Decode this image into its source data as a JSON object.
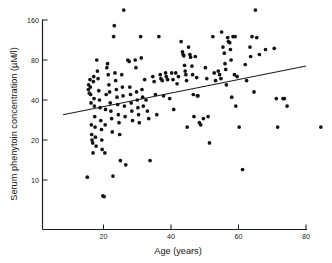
{
  "figure": {
    "name": "serum-phenytoin-vs-age-scatter"
  },
  "axis": {
    "x_title": "Age (years)",
    "y_title": "Serum phenytoin concentration (µM/l)",
    "x_ticks": [
      "20",
      "40",
      "60",
      "80"
    ],
    "y_ticks": [
      "160",
      "80",
      "40",
      "20",
      "10"
    ]
  },
  "chart_data": {
    "type": "scatter",
    "title": "",
    "subtitle": "",
    "xlabel": "Age (years)",
    "ylabel": "Serum phenytoin concentration (µM/l)",
    "xscale": "linear",
    "yscale": "log",
    "xlim": [
      8,
      86
    ],
    "ylim": [
      5,
      190
    ],
    "xticks": [
      20,
      40,
      60,
      80
    ],
    "yticks": [
      10,
      20,
      40,
      80,
      160
    ],
    "grid": false,
    "legend": null,
    "annotations": [],
    "series": [
      {
        "name": "patients",
        "marker": "filled-circle",
        "color": "#121212",
        "points": [
          [
            15.2,
            10.5
          ],
          [
            15.5,
            48
          ],
          [
            15.6,
            52
          ],
          [
            15.8,
            45
          ],
          [
            16.0,
            57
          ],
          [
            16.1,
            50
          ],
          [
            16.2,
            44
          ],
          [
            16.3,
            38
          ],
          [
            16.4,
            26
          ],
          [
            16.5,
            22
          ],
          [
            16.6,
            20
          ],
          [
            16.8,
            19
          ],
          [
            16.9,
            16
          ],
          [
            17.0,
            55
          ],
          [
            17.1,
            60
          ],
          [
            17.2,
            41
          ],
          [
            17.3,
            36
          ],
          [
            17.4,
            30
          ],
          [
            17.5,
            25
          ],
          [
            17.6,
            21
          ],
          [
            17.8,
            18
          ],
          [
            18.0,
            80
          ],
          [
            18.2,
            66
          ],
          [
            18.4,
            58
          ],
          [
            18.6,
            47
          ],
          [
            18.8,
            40
          ],
          [
            19.0,
            35
          ],
          [
            19.2,
            28
          ],
          [
            19.4,
            24
          ],
          [
            19.5,
            20
          ],
          [
            19.6,
            17
          ],
          [
            19.8,
            7.6
          ],
          [
            20.2,
            7.5
          ],
          [
            20.4,
            16
          ],
          [
            20.5,
            26
          ],
          [
            20.6,
            34
          ],
          [
            20.8,
            44
          ],
          [
            21.0,
            70
          ],
          [
            21.2,
            75
          ],
          [
            21.4,
            62
          ],
          [
            21.6,
            52
          ],
          [
            21.8,
            46
          ],
          [
            22.0,
            38
          ],
          [
            22.2,
            33
          ],
          [
            22.4,
            29
          ],
          [
            22.6,
            23
          ],
          [
            22.8,
            10.7
          ],
          [
            23.0,
            120
          ],
          [
            23.2,
            145
          ],
          [
            23.4,
            64
          ],
          [
            23.6,
            56
          ],
          [
            23.8,
            48
          ],
          [
            24.0,
            42
          ],
          [
            24.2,
            37
          ],
          [
            24.4,
            31
          ],
          [
            24.6,
            27
          ],
          [
            24.8,
            22
          ],
          [
            25.0,
            14
          ],
          [
            25.4,
            62
          ],
          [
            25.6,
            50
          ],
          [
            25.8,
            43
          ],
          [
            26.0,
            190
          ],
          [
            26.2,
            36
          ],
          [
            26.4,
            30
          ],
          [
            26.6,
            13
          ],
          [
            27.2,
            80
          ],
          [
            27.6,
            78
          ],
          [
            27.8,
            50
          ],
          [
            28.0,
            44
          ],
          [
            28.2,
            38
          ],
          [
            28.4,
            33
          ],
          [
            28.6,
            28
          ],
          [
            29.4,
            80
          ],
          [
            29.6,
            70
          ],
          [
            29.8,
            46
          ],
          [
            30.0,
            40
          ],
          [
            30.2,
            35
          ],
          [
            30.4,
            31
          ],
          [
            30.6,
            27
          ],
          [
            31.0,
            120
          ],
          [
            31.2,
            83
          ],
          [
            31.4,
            48
          ],
          [
            31.6,
            42
          ],
          [
            31.8,
            36
          ],
          [
            32.2,
            57
          ],
          [
            32.6,
            40
          ],
          [
            33.0,
            33
          ],
          [
            33.4,
            29
          ],
          [
            33.8,
            14
          ],
          [
            34.6,
            60
          ],
          [
            35.0,
            55
          ],
          [
            35.4,
            44
          ],
          [
            35.8,
            31
          ],
          [
            36.4,
            120
          ],
          [
            36.8,
            62
          ],
          [
            37.0,
            58
          ],
          [
            37.4,
            56
          ],
          [
            37.8,
            43
          ],
          [
            38.4,
            64
          ],
          [
            38.6,
            60
          ],
          [
            39.0,
            57
          ],
          [
            39.6,
            41
          ],
          [
            40.2,
            64
          ],
          [
            40.6,
            57
          ],
          [
            40.8,
            34
          ],
          [
            41.4,
            64
          ],
          [
            41.8,
            53
          ],
          [
            42.2,
            60
          ],
          [
            43.0,
            110
          ],
          [
            43.4,
            92
          ],
          [
            43.6,
            88
          ],
          [
            43.8,
            86
          ],
          [
            44.0,
            73
          ],
          [
            44.2,
            66
          ],
          [
            44.4,
            62
          ],
          [
            44.6,
            56
          ],
          [
            44.8,
            25
          ],
          [
            45.2,
            100
          ],
          [
            45.6,
            88
          ],
          [
            45.8,
            84
          ],
          [
            46.2,
            72
          ],
          [
            46.4,
            62
          ],
          [
            46.6,
            44
          ],
          [
            46.8,
            30
          ],
          [
            47.2,
            85
          ],
          [
            47.6,
            59
          ],
          [
            47.8,
            43
          ],
          [
            48.0,
            43
          ],
          [
            48.4,
            27
          ],
          [
            48.8,
            26
          ],
          [
            49.6,
            29
          ],
          [
            50.2,
            70
          ],
          [
            50.6,
            58
          ],
          [
            51.0,
            30
          ],
          [
            51.4,
            19
          ],
          [
            52.4,
            120
          ],
          [
            52.8,
            64
          ],
          [
            53.2,
            56
          ],
          [
            54.0,
            66
          ],
          [
            54.4,
            62
          ],
          [
            54.8,
            58
          ],
          [
            55.0,
            130
          ],
          [
            55.4,
            100
          ],
          [
            55.8,
            90
          ],
          [
            56.0,
            75
          ],
          [
            56.2,
            68
          ],
          [
            56.4,
            52
          ],
          [
            56.8,
            118
          ],
          [
            57.0,
            110
          ],
          [
            57.4,
            108
          ],
          [
            57.6,
            96
          ],
          [
            57.8,
            80
          ],
          [
            58.0,
            42
          ],
          [
            58.4,
            120
          ],
          [
            58.8,
            62
          ],
          [
            59.0,
            120
          ],
          [
            59.2,
            36
          ],
          [
            59.6,
            60
          ],
          [
            60.2,
            25
          ],
          [
            61.2,
            12
          ],
          [
            62.0,
            74
          ],
          [
            62.4,
            56
          ],
          [
            63.4,
            100
          ],
          [
            63.6,
            85
          ],
          [
            64.0,
            120
          ],
          [
            64.6,
            46
          ],
          [
            65.0,
            190
          ],
          [
            65.4,
            118
          ],
          [
            66.2,
            88
          ],
          [
            68.0,
            96
          ],
          [
            70.6,
            98
          ],
          [
            71.2,
            41
          ],
          [
            71.6,
            25
          ],
          [
            73.2,
            41
          ],
          [
            73.6,
            41
          ],
          [
            74.4,
            36
          ],
          [
            84.4,
            25
          ]
        ]
      }
    ],
    "fit_line": {
      "name": "regression-line",
      "x_start": 8,
      "y_start": 31,
      "x_end": 80,
      "y_end": 72
    }
  }
}
